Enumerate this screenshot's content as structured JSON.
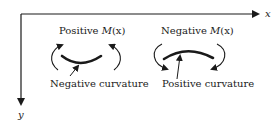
{
  "axes": {
    "x_label": "x",
    "y_label": "y"
  },
  "left_case": {
    "moment_prefix": "Positive ",
    "moment_symbol": "M",
    "moment_arg": "(x)",
    "curvature_label": "Negative curvature",
    "shape": "sagging (concave up)"
  },
  "right_case": {
    "moment_prefix": "Negative ",
    "moment_symbol": "M",
    "moment_arg": "(x)",
    "curvature_label": "Positive curvature",
    "shape": "hogging (concave down)"
  },
  "colors": {
    "ink": "#1a1a1a",
    "background": "#ffffff"
  }
}
